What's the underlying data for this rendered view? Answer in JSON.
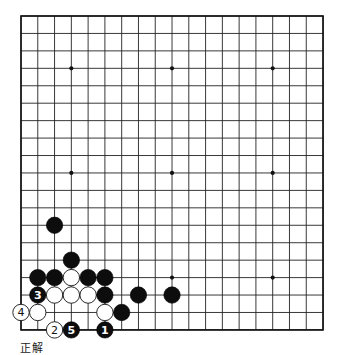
{
  "board": {
    "size": 19,
    "origin": {
      "x": 21,
      "y": 16
    },
    "spacing": {
      "x": 16.78,
      "y": 17.44
    },
    "stone_radius": 8.2,
    "colors": {
      "black": "#0d0d0d",
      "white": "#ffffff",
      "line": "#222222",
      "background": "#ffffff"
    },
    "star_points": [
      [
        3,
        3
      ],
      [
        9,
        3
      ],
      [
        15,
        3
      ],
      [
        3,
        9
      ],
      [
        9,
        9
      ],
      [
        15,
        9
      ],
      [
        3,
        15
      ],
      [
        9,
        15
      ],
      [
        15,
        15
      ]
    ],
    "stones": [
      {
        "color": "black",
        "col": 2,
        "row": 12,
        "label": ""
      },
      {
        "color": "black",
        "col": 3,
        "row": 14,
        "label": ""
      },
      {
        "color": "black",
        "col": 1,
        "row": 15,
        "label": ""
      },
      {
        "color": "black",
        "col": 2,
        "row": 15,
        "label": ""
      },
      {
        "color": "white",
        "col": 3,
        "row": 15,
        "label": ""
      },
      {
        "color": "black",
        "col": 4,
        "row": 15,
        "label": ""
      },
      {
        "color": "black",
        "col": 5,
        "row": 15,
        "label": ""
      },
      {
        "color": "black",
        "col": 1,
        "row": 16,
        "label": "3"
      },
      {
        "color": "white",
        "col": 2,
        "row": 16,
        "label": ""
      },
      {
        "color": "white",
        "col": 3,
        "row": 16,
        "label": ""
      },
      {
        "color": "white",
        "col": 4,
        "row": 16,
        "label": ""
      },
      {
        "color": "black",
        "col": 5,
        "row": 16,
        "label": ""
      },
      {
        "color": "black",
        "col": 7,
        "row": 16,
        "label": ""
      },
      {
        "color": "black",
        "col": 9,
        "row": 16,
        "label": ""
      },
      {
        "color": "white",
        "col": 0,
        "row": 17,
        "label": "4"
      },
      {
        "color": "white",
        "col": 1,
        "row": 17,
        "label": ""
      },
      {
        "color": "white",
        "col": 5,
        "row": 17,
        "label": ""
      },
      {
        "color": "black",
        "col": 6,
        "row": 17,
        "label": ""
      },
      {
        "color": "white",
        "col": 2,
        "row": 18,
        "label": "2"
      },
      {
        "color": "black",
        "col": 3,
        "row": 18,
        "label": "5"
      },
      {
        "color": "black",
        "col": 5,
        "row": 18,
        "label": "1"
      }
    ]
  },
  "caption": "正解"
}
